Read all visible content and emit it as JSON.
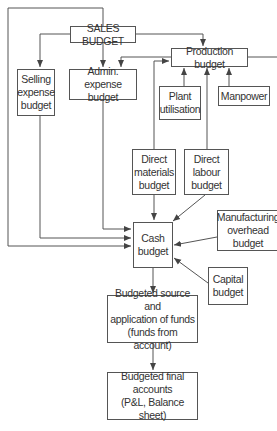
{
  "diagram": {
    "boxes": {
      "sales": "SALES BUDGET",
      "production": "Production budget",
      "selling": "Selling\nexpense\nbudget",
      "admin": "Admin. expense\nbudget",
      "plant": "Plant\nutilisation",
      "manpower": "Manpower",
      "materials": "Direct\nmaterials\nbudget",
      "labour": "Direct\nlabour\nbudget",
      "cash": "Cash\nbudget",
      "overhead": "Manufacturing\noverhead\nbudget",
      "capital": "Capital\nbudget",
      "funds": "Budgeted source and\napplication of funds\n(funds from  account)",
      "final": "Budgeted final\naccounts\n(P&L, Balance sheet)"
    },
    "colors": {
      "line": "#555555",
      "text": "#333333"
    }
  }
}
